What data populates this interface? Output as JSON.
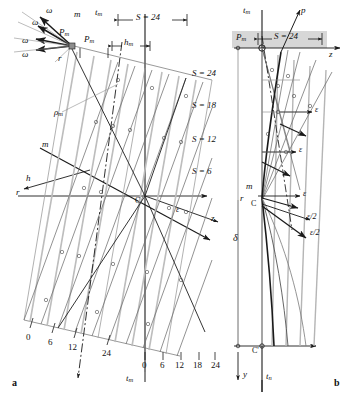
{
  "figure": {
    "type": "engineering-construction-diagram",
    "panels": [
      {
        "id": "a",
        "label": "a",
        "title": "left-construction-panel"
      },
      {
        "id": "b",
        "label": "b",
        "title": "right-construction-panel"
      }
    ]
  },
  "panel_a": {
    "vector_fan": {
      "apex_label": "P",
      "apex_sub": "m",
      "ray_labels": [
        "ω",
        "ω",
        "ω",
        "ω"
      ],
      "resultant_label": "m",
      "radius_label": "r"
    },
    "axes": {
      "vertical_label": "t",
      "vertical_sub": "m",
      "vertical_label_bottom": "t",
      "vertical_sub_bottom": "m",
      "horizontal_label": "r",
      "oblique_label": "z",
      "normal_label": "h",
      "center_label": "C",
      "epsilon_label": "ε"
    },
    "dimension": {
      "span_label": "S = 24",
      "pitch_label": "P",
      "pitch_sub": "m",
      "height_label": "h",
      "height_sub": "m"
    },
    "curve_labels": [
      {
        "text": "S = 24"
      },
      {
        "text": "S = 18"
      },
      {
        "text": "S = 12"
      },
      {
        "text": "S = 6"
      }
    ],
    "rho_label": "ρ",
    "rho_sub": "m",
    "m_axis_label": "m",
    "scale_oblique": [
      "0",
      "6",
      "12",
      "24"
    ],
    "scale_horizontal": [
      "0",
      "6",
      "12",
      "18",
      "24"
    ]
  },
  "panel_b": {
    "axes": {
      "vertical_top_label": "t",
      "vertical_top_sub": "m",
      "vertical_bottom_label": "t",
      "vertical_bottom_sub": "n",
      "horizontal_label": "z",
      "down_label": "y",
      "p_label": "p",
      "r_label": "r",
      "m_label": "m",
      "delta_label": "δ",
      "center_label": "C",
      "center_prime_label": "C'"
    },
    "dimension": {
      "span_label": "S = 24",
      "pitch_label": "P",
      "pitch_sub": "m"
    },
    "epsilon_labels": [
      "ε",
      "ε",
      "ε"
    ],
    "epsilon_half_labels": [
      "ε/2",
      "ε/2"
    ]
  },
  "colors": {
    "ink": "#1a1a1a",
    "grid": "#9a9a9a",
    "light": "#b8b8b8",
    "band": "#d7d7d7"
  }
}
